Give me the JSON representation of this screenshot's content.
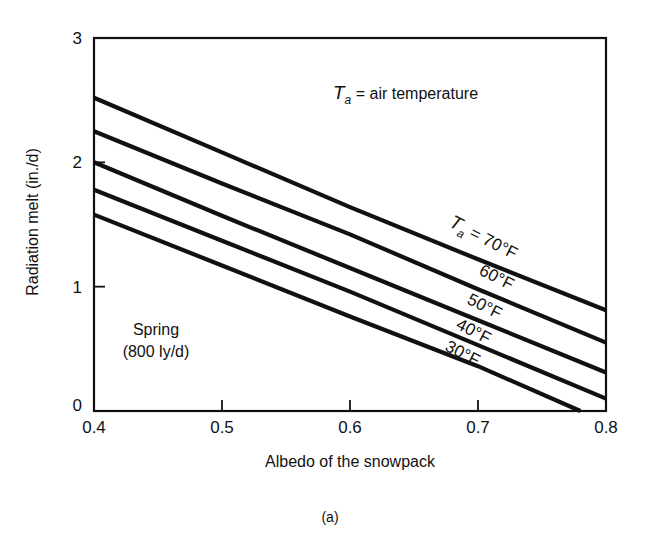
{
  "figure": {
    "caption": "(a)"
  },
  "chart_data": {
    "type": "line",
    "title": "",
    "xlabel": "Albedo of the snowpack",
    "ylabel": "Radiation melt (in./d)",
    "xlim": [
      0.4,
      0.8
    ],
    "ylim": [
      0,
      3
    ],
    "xticks": [
      0.4,
      0.5,
      0.6,
      0.7,
      0.8
    ],
    "xtick_labels": [
      "0.4",
      "0.5",
      "0.6",
      "0.7",
      "0.8"
    ],
    "yticks": [
      0,
      1,
      2,
      3
    ],
    "ytick_labels": [
      "0",
      "1",
      "2",
      "3"
    ],
    "grid": false,
    "legend": "inline labels on lines",
    "annotations": [
      {
        "text_main": "T",
        "text_sub": "a",
        "text_rest": " = air temperature"
      },
      {
        "text": "Spring"
      },
      {
        "text": "(800 ly/d)"
      }
    ],
    "series": [
      {
        "name": "Ta = 70°F",
        "label": "70°F",
        "label_prefix": "T",
        "label_sub": "a",
        "label_eq": " = ",
        "x": [
          0.4,
          0.5,
          0.6,
          0.7,
          0.8
        ],
        "values": [
          2.52,
          2.08,
          1.64,
          1.22,
          0.81
        ]
      },
      {
        "name": "60°F",
        "label": "60°F",
        "x": [
          0.4,
          0.5,
          0.6,
          0.7,
          0.8
        ],
        "values": [
          2.25,
          1.83,
          1.42,
          0.98,
          0.55
        ]
      },
      {
        "name": "50°F",
        "label": "50°F",
        "x": [
          0.4,
          0.5,
          0.6,
          0.7,
          0.8
        ],
        "values": [
          2.0,
          1.57,
          1.15,
          0.73,
          0.31
        ]
      },
      {
        "name": "40°F",
        "label": "40°F",
        "x": [
          0.4,
          0.5,
          0.6,
          0.7,
          0.8
        ],
        "values": [
          1.78,
          1.37,
          0.96,
          0.53,
          0.1
        ]
      },
      {
        "name": "30°F",
        "label": "30°F",
        "x": [
          0.4,
          0.5,
          0.6,
          0.7,
          0.78
        ],
        "values": [
          1.58,
          1.17,
          0.76,
          0.36,
          0.0
        ]
      }
    ]
  }
}
